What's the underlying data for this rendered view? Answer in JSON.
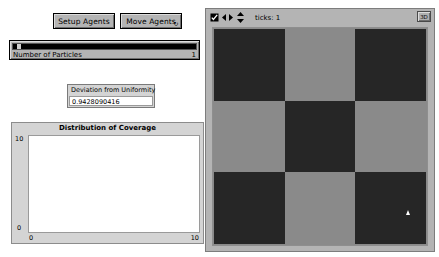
{
  "window": {
    "background_color": "#ffffff"
  },
  "controls": {
    "setup_button": {
      "label": "Setup Agents",
      "icon": "button-icon"
    },
    "move_button": {
      "label": "Move Agents",
      "icon": "forever-loop-icon",
      "forever_glyph": "↻"
    }
  },
  "slider": {
    "label": "Number of Particles",
    "value": "1",
    "fill_percent": 2,
    "track_color": "#000000"
  },
  "monitor": {
    "title": "Deviation from Uniformity",
    "value": "0.9428090416"
  },
  "chart_data": {
    "type": "line",
    "title": "Distribution of Coverage",
    "xlabel": "",
    "ylabel": "",
    "xlim": [
      0,
      10
    ],
    "ylim": [
      0,
      10
    ],
    "x_ticks": [
      "0",
      "10"
    ],
    "y_ticks": [
      "0",
      "10"
    ],
    "grid": false,
    "legend": null,
    "series": [
      {
        "name": "coverage",
        "x": [],
        "values": []
      }
    ],
    "note": "plot area is empty - no data plotted"
  },
  "view": {
    "toolbar": {
      "icons": [
        {
          "name": "select-patches-icon",
          "glyph": "◨"
        },
        {
          "name": "horizontal-resize-icon",
          "glyph": "◀▶"
        },
        {
          "name": "vertical-resize-icon",
          "glyph": "▲▼"
        }
      ],
      "ticks_label": "ticks: 1",
      "three_d_button": "3D"
    },
    "world": {
      "rows": 3,
      "cols": 3,
      "dark_color": "#262626",
      "light_color": "#8a8a8a",
      "patches": [
        [
          "dark",
          "light",
          "dark"
        ],
        [
          "light",
          "dark",
          "light"
        ],
        [
          "dark",
          "light",
          "dark"
        ]
      ],
      "turtles": [
        {
          "name": "turtle",
          "color": "#ffffff",
          "x_percent": 90,
          "y_percent": 84
        }
      ]
    }
  }
}
